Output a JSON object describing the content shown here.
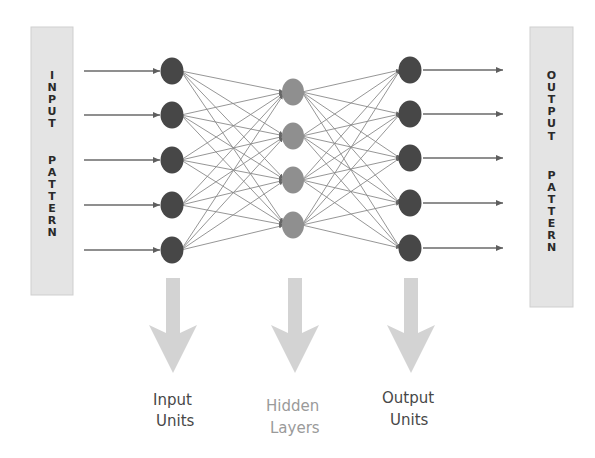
{
  "diagram": {
    "type": "feedforward-neural-network",
    "colors": {
      "background": "#ffffff",
      "pattern_box": "#e4e4e4",
      "pattern_box_edge": "#cfcfcf",
      "pattern_text": "#2a2a2a",
      "io_node": "#464646",
      "hidden_node": "#8f8f8f",
      "connection": "#8a8a8a",
      "io_arrow": "#6a6a6a",
      "layer_arrow": "#d3d3d3",
      "label_dark": "#474747",
      "label_light": "#9a9a9a"
    },
    "input_pattern": {
      "label": "INPUT PATTERN",
      "words": [
        "INPUT",
        "PATTERN"
      ],
      "box": {
        "x": 31,
        "y": 27,
        "w": 42,
        "h": 268
      }
    },
    "output_pattern": {
      "label": "OUTPUT PATTERN",
      "words": [
        "OUTPUT",
        "PATTERN"
      ],
      "box": {
        "x": 530,
        "y": 27,
        "w": 43,
        "h": 280
      }
    },
    "layers": [
      {
        "name": "input",
        "x": 172,
        "node_count": 5,
        "nodes_y": [
          71,
          115,
          160,
          205,
          250
        ],
        "label_lines": [
          "Input",
          "Units"
        ]
      },
      {
        "name": "hidden",
        "x": 293,
        "node_count": 4,
        "nodes_y": [
          92,
          136,
          180,
          225
        ],
        "label_lines": [
          "Hidden",
          "Layers"
        ]
      },
      {
        "name": "output",
        "x": 410,
        "node_count": 5,
        "nodes_y": [
          70,
          114,
          158,
          203,
          248
        ],
        "label_lines": [
          "Output",
          "Units"
        ]
      }
    ],
    "input_arrows": {
      "x_start": 84,
      "x_end": 160
    },
    "output_arrows": {
      "x_start": 423,
      "x_end": 503
    },
    "labels": {
      "input": {
        "line1": "Input",
        "line2": "Units"
      },
      "hidden": {
        "line1": "Hidden",
        "line2": "Layers"
      },
      "output": {
        "line1": "Output",
        "line2": "Units"
      }
    }
  }
}
